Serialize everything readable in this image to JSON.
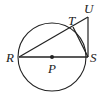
{
  "diagram": {
    "type": "geometry",
    "circle": {
      "center": "P",
      "cx": 52,
      "cy": 57,
      "r": 34
    },
    "points": {
      "R": {
        "label": "R",
        "x": 18,
        "y": 57
      },
      "S": {
        "label": "S",
        "x": 88,
        "y": 57
      },
      "P": {
        "label": "P",
        "x": 52,
        "y": 57
      },
      "T": {
        "label": "T",
        "x": 73,
        "y": 27
      },
      "U": {
        "label": "U",
        "x": 88,
        "y": 17
      }
    },
    "segments": [
      [
        "R",
        "S"
      ],
      [
        "R",
        "U"
      ],
      [
        "T",
        "S"
      ],
      [
        "S",
        "U"
      ]
    ],
    "stroke_color": "#222222"
  }
}
